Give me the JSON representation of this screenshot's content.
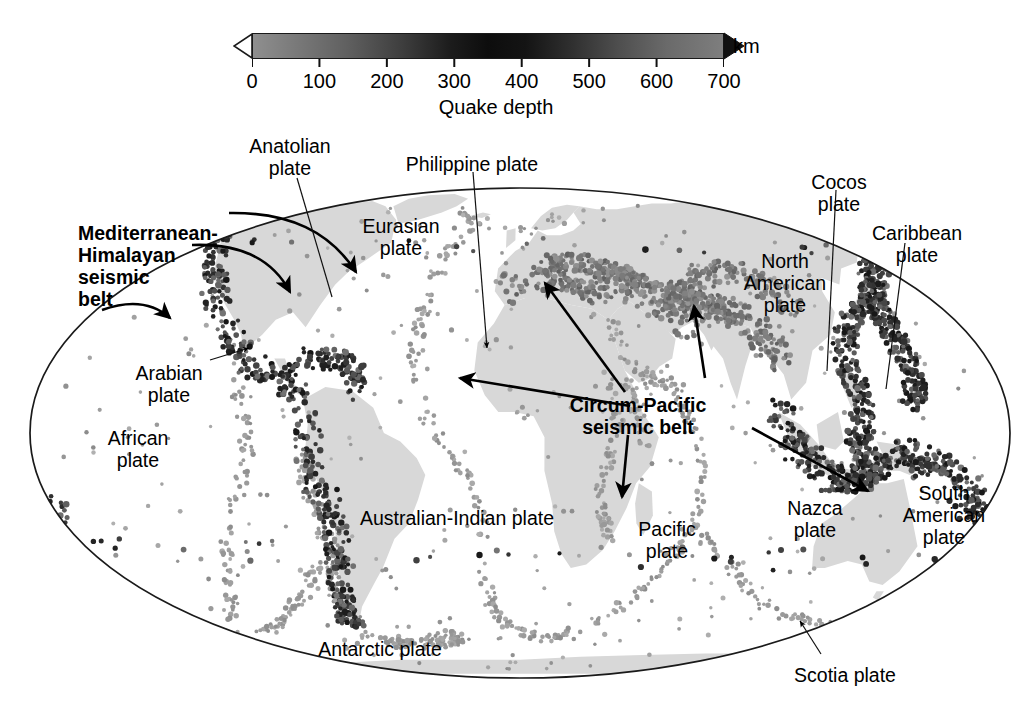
{
  "figure": {
    "type": "map",
    "projection": "mollweide"
  },
  "colorbar": {
    "caption": "Quake depth",
    "unit_label": "km",
    "ticks": [
      {
        "value": 0,
        "label": "0"
      },
      {
        "value": 100,
        "label": "100"
      },
      {
        "value": 200,
        "label": "200"
      },
      {
        "value": 300,
        "label": "300"
      },
      {
        "value": 400,
        "label": "400"
      },
      {
        "value": 500,
        "label": "500"
      },
      {
        "value": 600,
        "label": "600"
      },
      {
        "value": 700,
        "label": "700"
      }
    ],
    "range": [
      0,
      700
    ],
    "gradient_stops": [
      {
        "pos": 0,
        "color": "#8f8f8f"
      },
      {
        "pos": 20,
        "color": "#606060"
      },
      {
        "pos": 42,
        "color": "#1c1c1c"
      },
      {
        "pos": 50,
        "color": "#0d0d0d"
      },
      {
        "pos": 68,
        "color": "#303030"
      },
      {
        "pos": 88,
        "color": "#6a6a6a"
      },
      {
        "pos": 100,
        "color": "#7e7e7e"
      }
    ],
    "left_cap": "open-triangle-left",
    "right_cap": "filled-triangle-right"
  },
  "map": {
    "outline_color": "#1a1a1a",
    "continent_color": "#d8d8d8",
    "shallow_quake_color": "#9a9a9a",
    "deep_quake_color": "#1e1e1e",
    "background": "#ffffff"
  },
  "belts": [
    {
      "id": "mediterranean-himalayan",
      "label": "Mediterranean-\nHimalayan\nseismic\nbelt",
      "bold": true,
      "x": 78,
      "y": 222,
      "arrows": 3
    },
    {
      "id": "circum-pacific",
      "label": "Circum-Pacific\nseismic belt",
      "bold": true,
      "x": 638,
      "y": 394,
      "arrows": 4
    }
  ],
  "plates": [
    {
      "id": "anatolian",
      "label": "Anatolian\nplate",
      "x": 290,
      "y": 135,
      "align": "center",
      "leader": "line"
    },
    {
      "id": "philippine",
      "label": "Philippine plate",
      "x": 472,
      "y": 153,
      "align": "center",
      "leader": "line"
    },
    {
      "id": "eurasian",
      "label": "Eurasian\nplate",
      "x": 401,
      "y": 215,
      "align": "center",
      "leader": "none"
    },
    {
      "id": "cocos",
      "label": "Cocos\nplate",
      "x": 839,
      "y": 171,
      "align": "center",
      "leader": "line"
    },
    {
      "id": "caribbean",
      "label": "Caribbean\nplate",
      "x": 917,
      "y": 222,
      "align": "center",
      "leader": "line"
    },
    {
      "id": "north-american",
      "label": "North\nAmerican\nplate",
      "x": 785,
      "y": 250,
      "align": "center",
      "leader": "none"
    },
    {
      "id": "arabian",
      "label": "Arabian\nplate",
      "x": 169,
      "y": 362,
      "align": "center",
      "leader": "arrow"
    },
    {
      "id": "african",
      "label": "African\nplate",
      "x": 138,
      "y": 427,
      "align": "center",
      "leader": "none"
    },
    {
      "id": "australian-indian",
      "label": "Australian-Indian plate",
      "x": 457,
      "y": 507,
      "align": "center",
      "leader": "none"
    },
    {
      "id": "pacific",
      "label": "Pacific\nplate",
      "x": 667,
      "y": 518,
      "align": "center",
      "leader": "none"
    },
    {
      "id": "nazca",
      "label": "Nazca\nplate",
      "x": 815,
      "y": 497,
      "align": "center",
      "leader": "none"
    },
    {
      "id": "south-american",
      "label": "South\nAmerican\nplate",
      "x": 944,
      "y": 482,
      "align": "center",
      "leader": "none"
    },
    {
      "id": "antarctic",
      "label": "Antarctic plate",
      "x": 380,
      "y": 638,
      "align": "center",
      "leader": "none"
    },
    {
      "id": "scotia",
      "label": "Scotia plate",
      "x": 845,
      "y": 664,
      "align": "center",
      "leader": "arrow"
    }
  ],
  "chart_data": {
    "type": "map",
    "title": "",
    "legend_title": "Quake depth",
    "legend_unit": "km",
    "legend_range": [
      0,
      700
    ],
    "legend_ticks": [
      0,
      100,
      200,
      300,
      400,
      500,
      600,
      700
    ],
    "annotations": [
      "Mediterranean-Himalayan seismic belt",
      "Circum-Pacific seismic belt"
    ],
    "plate_names": [
      "Anatolian plate",
      "Philippine plate",
      "Eurasian plate",
      "Cocos plate",
      "Caribbean plate",
      "North American plate",
      "Arabian plate",
      "African plate",
      "Australian-Indian plate",
      "Pacific plate",
      "Nazca plate",
      "South American plate",
      "Antarctic plate",
      "Scotia plate"
    ]
  }
}
